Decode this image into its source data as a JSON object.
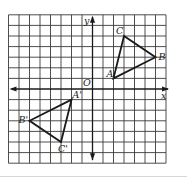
{
  "figure": {
    "type": "coordinate-plane",
    "grid": {
      "x_min": -8,
      "x_max": 7,
      "y_min": -7,
      "y_max": 7,
      "step": 1
    },
    "axes": {
      "x_label": "x",
      "y_label": "y",
      "origin_label": "O"
    },
    "transformation": "rotation 180° about origin O",
    "triangles": [
      {
        "name": "ABC",
        "vertices": [
          {
            "label": "A",
            "x": 2,
            "y": 1
          },
          {
            "label": "B",
            "x": 6,
            "y": 3
          },
          {
            "label": "C",
            "x": 3,
            "y": 5
          }
        ]
      },
      {
        "name": "A'B'C'",
        "vertices": [
          {
            "label": "A'",
            "x": -2,
            "y": -1
          },
          {
            "label": "B'",
            "x": -6,
            "y": -3
          },
          {
            "label": "C'",
            "x": -3,
            "y": -5
          }
        ]
      }
    ],
    "colors": {
      "grid": "#3a3a3a",
      "axes": "#1a1a1a",
      "triangle": "#1a1a1a",
      "background": "#ffffff"
    }
  }
}
